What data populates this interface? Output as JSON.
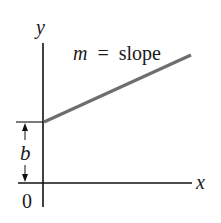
{
  "diagram": {
    "type": "line-graph-illustration",
    "axes": {
      "y_label": "y",
      "x_label": "x",
      "origin_label": "0"
    },
    "line": {
      "label_var": "m",
      "label_eq": "=",
      "label_text": "slope",
      "color": "#6e6e6e"
    },
    "intercept": {
      "label": "b"
    },
    "colors": {
      "axis": "#111111",
      "background": "#ffffff"
    }
  }
}
